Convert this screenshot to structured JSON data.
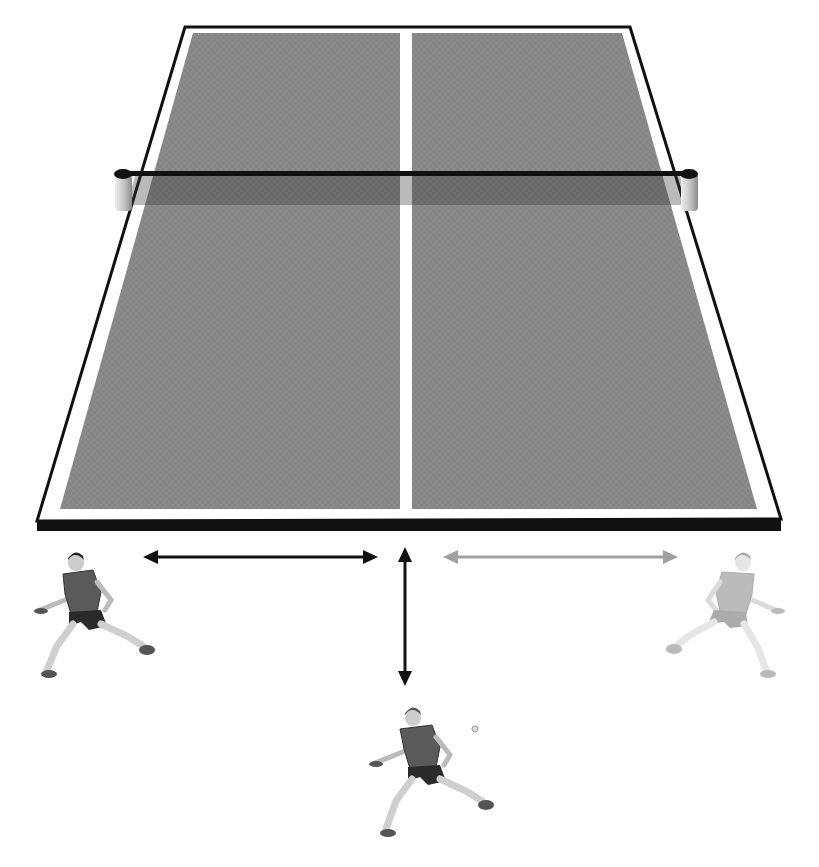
{
  "diagram": {
    "colors": {
      "background": "#ffffff",
      "table_surface": "#8a8a8a",
      "table_surface_dark": "#6e6e6e",
      "table_line": "#ffffff",
      "table_edge": "#111111",
      "net": "#111111",
      "net_shadow": "#5c5c5c",
      "arrow_primary": "#111111",
      "arrow_secondary": "#a0a0a0",
      "player_shirt": "#5a5a5a",
      "player_shorts": "#2a2a2a",
      "player_skin": "#cfcfcf",
      "player_faded_shirt": "#b8b8b8",
      "player_faded_shorts": "#9a9a9a"
    },
    "arrows": [
      {
        "id": "left-lateral",
        "direction": "horizontal-both",
        "style": "primary"
      },
      {
        "id": "forward-backward",
        "direction": "vertical-both",
        "style": "primary"
      },
      {
        "id": "right-lateral",
        "direction": "horizontal-both",
        "style": "secondary"
      }
    ],
    "players": [
      {
        "id": "left-player",
        "position": "left",
        "style": "solid"
      },
      {
        "id": "center-player",
        "position": "back-center",
        "style": "solid"
      },
      {
        "id": "right-player",
        "position": "right",
        "style": "faded"
      }
    ]
  }
}
